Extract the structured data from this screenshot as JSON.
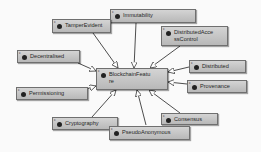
{
  "diagram": {
    "center": {
      "id": "BlockchainFeatures",
      "label": "BlockchainFeatu\nre"
    },
    "nodes": [
      {
        "id": "Immutability",
        "label": "Immutability"
      },
      {
        "id": "TamperEvident",
        "label": "TamperEvident"
      },
      {
        "id": "DistributedAccessControl",
        "label": "DistributedAcce\nssControl"
      },
      {
        "id": "Decentralised",
        "label": "Decentralised"
      },
      {
        "id": "Distributed",
        "label": "Distributed"
      },
      {
        "id": "Provenance",
        "label": "Provenance"
      },
      {
        "id": "Permissioning",
        "label": "Permissioning"
      },
      {
        "id": "Consensus",
        "label": "Consensus"
      },
      {
        "id": "Cryptography",
        "label": "Cryptography"
      },
      {
        "id": "PseudoAnonymous",
        "label": "PseudoAnonymous"
      }
    ],
    "node_marker": "c",
    "edges": [
      {
        "from": "Immutability",
        "to": "BlockchainFeatures"
      },
      {
        "from": "TamperEvident",
        "to": "BlockchainFeatures"
      },
      {
        "from": "DistributedAccessControl",
        "to": "BlockchainFeatures"
      },
      {
        "from": "Decentralised",
        "to": "BlockchainFeatures"
      },
      {
        "from": "Distributed",
        "to": "BlockchainFeatures"
      },
      {
        "from": "Provenance",
        "to": "BlockchainFeatures"
      },
      {
        "from": "Permissioning",
        "to": "BlockchainFeatures"
      },
      {
        "from": "Consensus",
        "to": "BlockchainFeatures"
      },
      {
        "from": "Cryptography",
        "to": "BlockchainFeatures"
      },
      {
        "from": "PseudoAnonymous",
        "to": "BlockchainFeatures"
      }
    ],
    "colors": {
      "background": "#fafafa",
      "node_fill_top": "#d4d4d4",
      "node_fill_bottom": "#b8b8b8",
      "node_border": "#6f6f6f",
      "edge": "#3a3a3a",
      "arrowhead_fill": "#ffffff"
    }
  }
}
